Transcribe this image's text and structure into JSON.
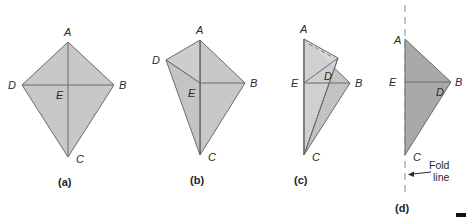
{
  "colors": {
    "kite_fill": "#c8c8c8",
    "kite_fill_front": "#cfcfcf",
    "kite_fill_back": "#bdbdbd",
    "folded_fill": "#a9a9a9",
    "edge": "#6b6b6b",
    "fold_line": "#8a8a8a"
  },
  "figures": [
    {
      "id": "a",
      "caption": "(a)",
      "labels": {
        "A": "A",
        "B": "B",
        "C": "C",
        "D": "D",
        "E": "E"
      }
    },
    {
      "id": "b",
      "caption": "(b)",
      "labels": {
        "A": "A",
        "B": "B",
        "C": "C",
        "D": "D",
        "E": "E"
      }
    },
    {
      "id": "c",
      "caption": "(c)",
      "labels": {
        "A": "A",
        "B": "B",
        "C": "C",
        "D": "D",
        "E": "E"
      }
    },
    {
      "id": "d",
      "caption": "(d)",
      "labels": {
        "A": "A",
        "B": "B",
        "C": "C",
        "D": "D",
        "E": "E"
      },
      "fold_note_line1": "Fold",
      "fold_note_line2": "line"
    }
  ]
}
